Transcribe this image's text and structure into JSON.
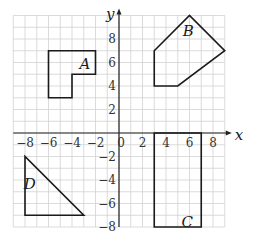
{
  "diagram": {
    "type": "coordinate-grid",
    "x_axis_label": "x",
    "y_axis_label": "y",
    "x_range": [
      -9,
      9
    ],
    "y_range": [
      -8,
      10
    ],
    "grid_step": 1,
    "x_ticks": [
      {
        "value": -8,
        "label": "−8"
      },
      {
        "value": -6,
        "label": "−6"
      },
      {
        "value": -4,
        "label": "−4"
      },
      {
        "value": -2,
        "label": "−2"
      },
      {
        "value": 0,
        "label": "0"
      },
      {
        "value": 2,
        "label": "2"
      },
      {
        "value": 4,
        "label": "4"
      },
      {
        "value": 6,
        "label": "6"
      },
      {
        "value": 8,
        "label": "8"
      }
    ],
    "y_ticks": [
      {
        "value": 8,
        "label": "8"
      },
      {
        "value": 6,
        "label": "6"
      },
      {
        "value": 4,
        "label": "4"
      },
      {
        "value": 2,
        "label": "2"
      },
      {
        "value": -2,
        "label": "−2"
      },
      {
        "value": -4,
        "label": "−4"
      },
      {
        "value": -6,
        "label": "−6"
      },
      {
        "value": -8,
        "label": "−8"
      }
    ],
    "shapes": [
      {
        "name": "A",
        "label": "A",
        "label_pos": [
          -2.9,
          5.9
        ],
        "points": [
          [
            -6,
            7
          ],
          [
            -2,
            7
          ],
          [
            -2,
            5
          ],
          [
            -4,
            5
          ],
          [
            -4,
            3
          ],
          [
            -6,
            3
          ]
        ]
      },
      {
        "name": "B",
        "label": "B",
        "label_pos": [
          5.9,
          8.7
        ],
        "points": [
          [
            3,
            7
          ],
          [
            6,
            10
          ],
          [
            9,
            7
          ],
          [
            5,
            4
          ],
          [
            3,
            4
          ]
        ]
      },
      {
        "name": "C",
        "label": "C",
        "label_pos": [
          5.8,
          -7.6
        ],
        "points": [
          [
            3,
            0
          ],
          [
            7,
            0
          ],
          [
            7,
            -8
          ],
          [
            3,
            -8
          ]
        ]
      },
      {
        "name": "D",
        "label": "D",
        "label_pos": [
          -7.6,
          -4.3
        ],
        "points": [
          [
            -8,
            -2
          ],
          [
            -8,
            -7
          ],
          [
            -3,
            -7
          ]
        ]
      }
    ],
    "colors": {
      "grid": "#d2d2d2",
      "axis": "#222222",
      "shape": "#1a1a1a"
    }
  }
}
